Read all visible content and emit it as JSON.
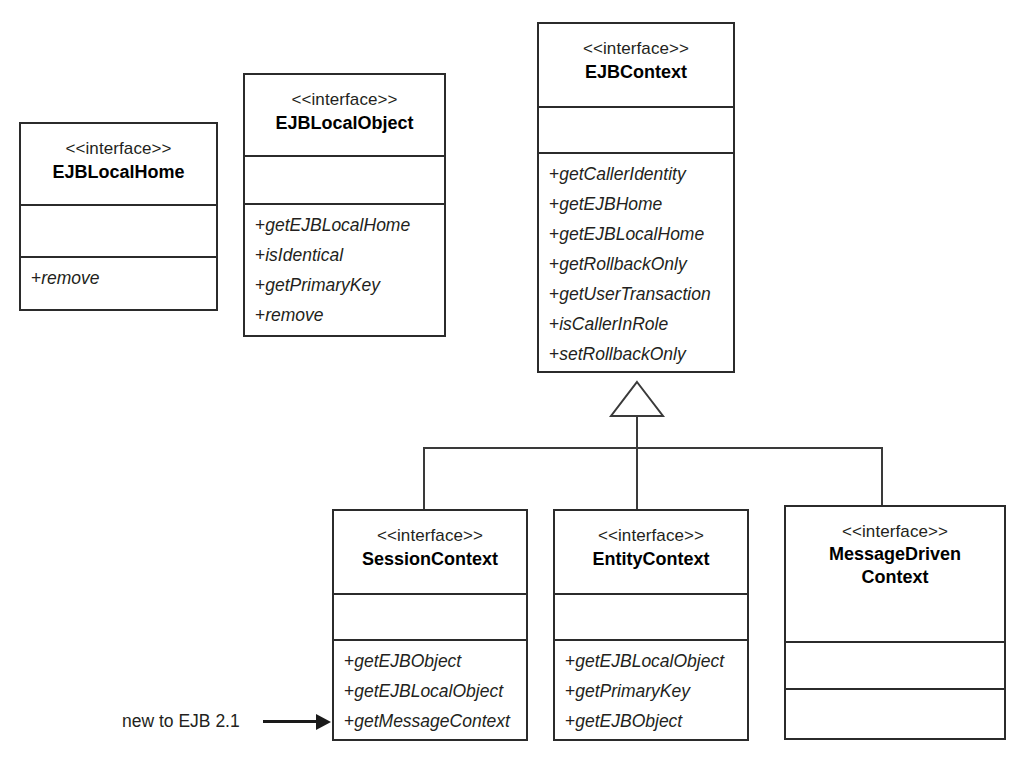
{
  "diagram": {
    "type": "uml-class-diagram",
    "stereotype_label": "<<interface>>",
    "background_color": "#ffffff",
    "line_color": "#2b2b2b",
    "text_color": "#231f20"
  },
  "classes": [
    {
      "id": "ejblocalhome",
      "name": "EJBLocalHome",
      "stereotype": "<<interface>>",
      "attributes": [],
      "operations": [
        "+remove"
      ]
    },
    {
      "id": "ejblocalobject",
      "name": "EJBLocalObject",
      "stereotype": "<<interface>>",
      "attributes": [],
      "operations": [
        "+getEJBLocalHome",
        "+isIdentical",
        "+getPrimaryKey",
        "+remove"
      ]
    },
    {
      "id": "ejbcontext",
      "name": "EJBContext",
      "stereotype": "<<interface>>",
      "attributes": [],
      "operations": [
        "+getCallerIdentity",
        "+getEJBHome",
        "+getEJBLocalHome",
        "+getRollbackOnly",
        "+getUserTransaction",
        "+isCallerInRole",
        "+setRollbackOnly"
      ]
    },
    {
      "id": "sessioncontext",
      "name": "SessionContext",
      "stereotype": "<<interface>>",
      "attributes": [],
      "operations": [
        "+getEJBObject",
        "+getEJBLocalObject",
        "+getMessageContext"
      ]
    },
    {
      "id": "entitycontext",
      "name": "EntityContext",
      "stereotype": "<<interface>>",
      "attributes": [],
      "operations": [
        "+getEJBLocalObject",
        "+getPrimaryKey",
        "+getEJBObject"
      ]
    },
    {
      "id": "messagedrivencontext",
      "name_line1": "MessageDriven",
      "name_line2": "Context",
      "name": "MessageDrivenContext",
      "stereotype": "<<interface>>",
      "attributes": [],
      "operations": []
    }
  ],
  "relationships": [
    {
      "type": "generalization",
      "parent": "EJBContext",
      "children": [
        "SessionContext",
        "EntityContext",
        "MessageDrivenContext"
      ]
    }
  ],
  "annotations": [
    {
      "id": "new-to-ejb-21",
      "text": "new to EJB 2.1",
      "points_to": "+getMessageContext",
      "target_class": "SessionContext"
    }
  ]
}
